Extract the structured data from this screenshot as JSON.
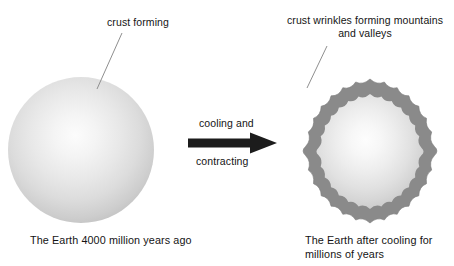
{
  "diagram": {
    "title_text_present": false,
    "labels": {
      "crust_forming": "crust forming",
      "crust_wrinkles": "crust wrinkles forming mountains and valleys",
      "cooling": "cooling and",
      "contracting": "contracting"
    },
    "captions": {
      "left": "The Earth 4000 million years ago",
      "right": "The Earth after cooling for millions of years"
    },
    "colors": {
      "background": "#ffffff",
      "text": "#141414",
      "arrow": "#1c1c1c",
      "leader_line": "#8f8f8f",
      "young_planet_highlight": "#fcfcfc",
      "young_planet_rim": "#9a9a9a",
      "crust_ring": "#8a8a8a",
      "crust_ring_outline": "#7a7a7a",
      "cooled_interior_highlight": "#fdfdfd",
      "cooled_interior_edge": "#c9c9c9"
    },
    "shapes": {
      "young_planet": {
        "cx": 81,
        "cy": 150,
        "r": 73,
        "style": "radial-gradient-sphere"
      },
      "cooled_planet": {
        "cx": 370,
        "cy": 151,
        "outer_r": 73,
        "inner_r": 58,
        "lobes": 16,
        "style": "scalloped-crust-ring"
      },
      "arrow": {
        "direction": "right",
        "x": 188,
        "y": 132,
        "width": 90,
        "height": 22
      }
    }
  }
}
